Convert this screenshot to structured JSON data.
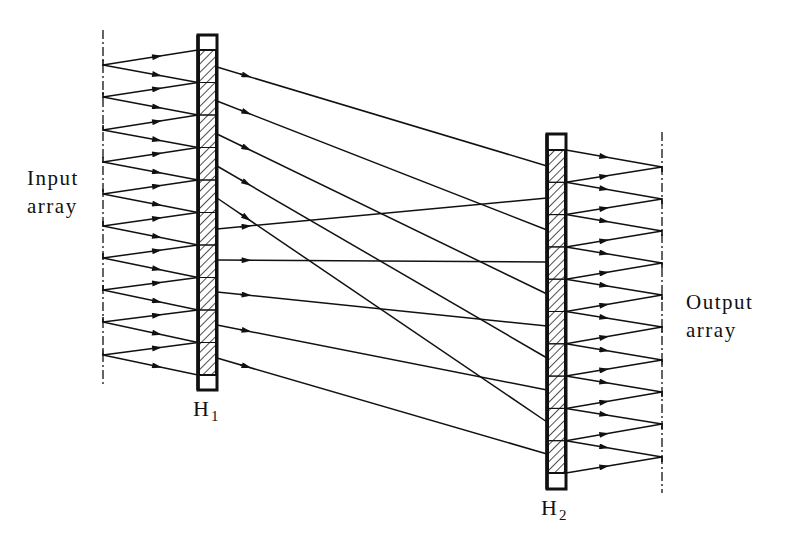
{
  "labels": {
    "input_line1": "Input",
    "input_line2": "array",
    "output_line1": "Output",
    "output_line2": "array",
    "h1_main": "H",
    "h1_sub": "1",
    "h2_main": "H",
    "h2_sub": "2"
  },
  "colors": {
    "ink": "#111111",
    "background": "#ffffff",
    "hatch": "#222222"
  },
  "geometry": {
    "input_array": {
      "x": 103,
      "y_top": 30,
      "y_bottom": 385
    },
    "output_array": {
      "x": 662,
      "y_top": 132,
      "y_bottom": 493
    },
    "h1": {
      "x_left": 198,
      "x_right": 217,
      "y_top": 35,
      "y_bottom": 390,
      "seg_top": 50,
      "seg_bottom": 375,
      "segments": 10
    },
    "h2": {
      "x_left": 547,
      "x_right": 566,
      "y_top": 134,
      "y_bottom": 489,
      "seg_top": 150,
      "seg_bottom": 473,
      "segments": 10
    },
    "input_sources_y": [
      65,
      97,
      130,
      162,
      194,
      226,
      258,
      290,
      322,
      355
    ],
    "output_targets_y": [
      167,
      199,
      231,
      263,
      295,
      327,
      360,
      392,
      424,
      457
    ],
    "interconnect": {
      "h1_out_y": [
        67,
        101,
        134,
        166,
        198,
        229,
        260,
        292,
        325,
        358
      ],
      "h2_in_y": [
        166,
        230,
        294,
        358,
        422,
        198,
        262,
        326,
        390,
        454
      ]
    }
  }
}
